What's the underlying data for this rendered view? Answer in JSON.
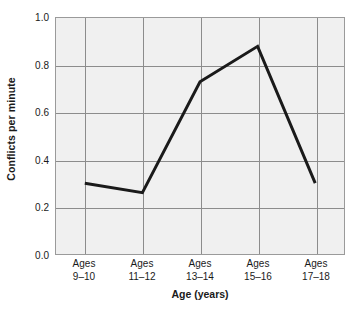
{
  "chart_data": {
    "type": "line",
    "title": "",
    "subtitle": "",
    "xlabel": "Age (years)",
    "ylabel": "Conflicts per minute",
    "categories": [
      "Ages 9–10",
      "Ages 11–12",
      "Ages 13–14",
      "Ages 15–16",
      "Ages 17–18"
    ],
    "category_lines": [
      {
        "line1": "Ages",
        "line2": "9–10"
      },
      {
        "line1": "Ages",
        "line2": "11–12"
      },
      {
        "line1": "Ages",
        "line2": "13–14"
      },
      {
        "line1": "Ages",
        "line2": "15–16"
      },
      {
        "line1": "Ages",
        "line2": "17–18"
      }
    ],
    "values": [
      0.3,
      0.26,
      0.73,
      0.88,
      0.3
    ],
    "ylim": [
      0.0,
      1.0
    ],
    "ytick_values": [
      0.0,
      0.2,
      0.4,
      0.6,
      0.8,
      1.0
    ],
    "ytick_labels": [
      "0.0",
      "0.2",
      "0.4",
      "0.6",
      "0.8",
      "1.0"
    ],
    "grid": {
      "horizontal": true,
      "vertical": true
    },
    "legend": {
      "visible": false,
      "position": "none"
    },
    "series": [
      {
        "name": "Conflicts per minute",
        "values": [
          0.3,
          0.26,
          0.73,
          0.88,
          0.3
        ]
      }
    ],
    "colors": {
      "line": "#1a1a1a",
      "plot_background": "#f0f0f0",
      "grid": "#8c8c8c",
      "border": "#9a9a9a",
      "text": "#1a1a1a",
      "figure_background": "#ffffff"
    },
    "line_width_px": 3,
    "markers": "none"
  }
}
